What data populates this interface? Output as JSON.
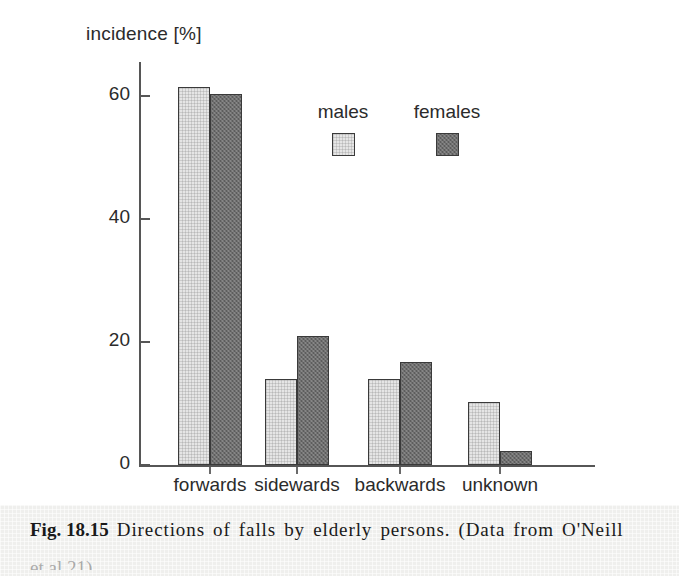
{
  "figure": {
    "caption_prefix": "Fig. 18.15",
    "caption_text": " Directions of falls by elderly persons. (Data from O'Neill",
    "caption_continuation": "et al.21)"
  },
  "legend": {
    "entries": [
      {
        "label": "males",
        "color": "#e5e5e5"
      },
      {
        "label": "females",
        "color": "#6f6f6f"
      }
    ]
  },
  "axis": {
    "y_title": "incidence [%]",
    "y_ticks": [
      "60",
      "40",
      "20",
      "0"
    ]
  },
  "chart_data": {
    "type": "bar",
    "title": "Directions of falls by elderly persons",
    "xlabel": "",
    "ylabel": "incidence [%]",
    "ylim": [
      0,
      65
    ],
    "yticks": [
      0,
      20,
      40,
      60
    ],
    "grid": false,
    "legend_position": "upper-center",
    "categories": [
      "forwards",
      "sidewards",
      "backwards",
      "unknown"
    ],
    "series": [
      {
        "name": "males",
        "color": "#e5e5e5",
        "values": [
          61.5,
          14.0,
          14.0,
          10.3
        ]
      },
      {
        "name": "females",
        "color": "#6f6f6f",
        "values": [
          60.3,
          21.0,
          16.7,
          2.2
        ]
      }
    ]
  }
}
